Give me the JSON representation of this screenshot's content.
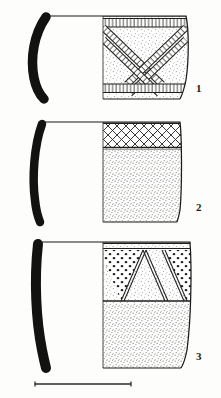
{
  "plate": {
    "type": "archaeological-pottery-illustration",
    "background_color": "#fdfdfb",
    "ink_color": "#1a1a1a",
    "stipple_color": "#8a8a86",
    "width": 221,
    "height": 398,
    "description": "Plate of three ceramic vessel profile drawings with incised and punctate decoration"
  },
  "vessels": [
    {
      "number": "1",
      "label_x": 196,
      "label_y": 92,
      "rim_y": 16,
      "base_y": 99,
      "axis_x": 103,
      "profile": {
        "style": "solid-black-section",
        "form": "everted-curved-wall",
        "top_x": 44,
        "bottom_x": 38
      },
      "body_outline": {
        "max_x": 186,
        "shoulder_y": 44,
        "waist_y": 92,
        "form": "convex-carinated"
      },
      "decoration": [
        {
          "zone": "rim-band",
          "motif": "horizontal-ladder-hatched-band",
          "y_top": 18,
          "y_bottom": 27
        },
        {
          "zone": "main-panel",
          "motif": "diagonal-ladder-bands-chevron",
          "y_top": 27,
          "y_bottom": 82
        },
        {
          "zone": "lower-band",
          "motif": "horizontal-ladder-hatched-band",
          "y_top": 84,
          "y_bottom": 93
        }
      ],
      "surface": "stippled"
    },
    {
      "number": "2",
      "label_x": 196,
      "label_y": 211,
      "rim_y": 122,
      "base_y": 222,
      "axis_x": 103,
      "profile": {
        "style": "solid-black-section",
        "form": "slightly-curved-wall",
        "top_x": 40,
        "bottom_x": 38
      },
      "body_outline": {
        "max_x": 180,
        "shoulder_y": 130,
        "waist_y": 215,
        "form": "near-straight-flaring"
      },
      "decoration": [
        {
          "zone": "rim-band",
          "motif": "cross-hatched-lattice-diamonds",
          "y_top": 123,
          "y_bottom": 148
        },
        {
          "zone": "body",
          "motif": "plain-stippled",
          "y_top": 150,
          "y_bottom": 222
        }
      ],
      "surface": "stippled"
    },
    {
      "number": "3",
      "label_x": 196,
      "label_y": 360,
      "rim_y": 242,
      "base_y": 368,
      "axis_x": 103,
      "profile": {
        "style": "solid-black-section",
        "form": "straight-angled-wall",
        "top_x": 36,
        "bottom_x": 46
      },
      "body_outline": {
        "max_x": 190,
        "shoulder_y": 250,
        "waist_y": 360,
        "form": "straight-flaring"
      },
      "decoration": [
        {
          "zone": "rim-line",
          "motif": "double-horizontal-line",
          "y_top": 243,
          "y_bottom": 249
        },
        {
          "zone": "main-panel",
          "motif": "alternating-punctate-and-blank-triangles",
          "y_top": 249,
          "y_bottom": 300
        },
        {
          "zone": "divider",
          "motif": "horizontal-line",
          "y_top": 300,
          "y_bottom": 303
        },
        {
          "zone": "body",
          "motif": "plain-stippled",
          "y_top": 303,
          "y_bottom": 368
        }
      ],
      "surface": "stippled"
    }
  ],
  "scale_bar": {
    "present": true,
    "label": "",
    "x_start": 35,
    "x_end": 131,
    "y": 384,
    "tick_height": 5,
    "style": "plain-line-with-end-ticks"
  }
}
